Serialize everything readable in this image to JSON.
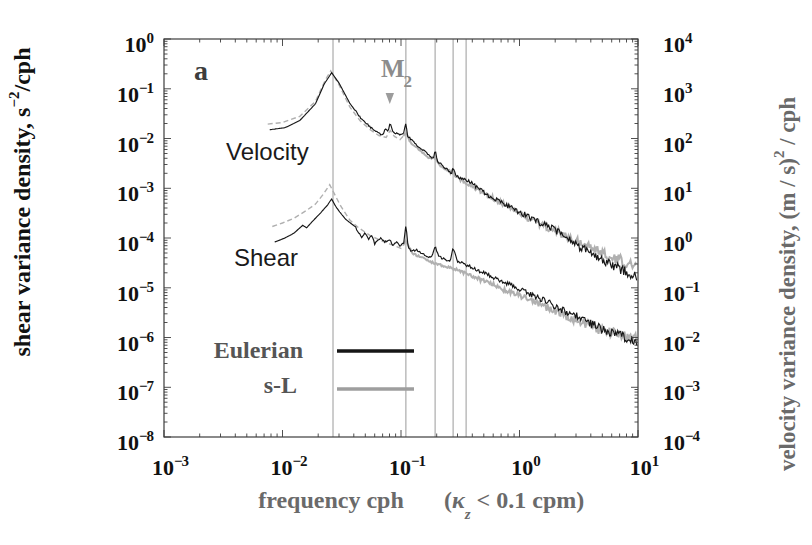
{
  "figure": {
    "panel_label": "a",
    "background": "#ffffff"
  },
  "colors": {
    "eulerian": "#161616",
    "sl": "#b0b0b0",
    "legend_sl_line": "#9e9e9e",
    "grid": "#9a9a9a",
    "frame": "#3c3c3c",
    "tick_text": "#111111",
    "muted_text": "#6a6a6a",
    "legend_text": "#555555",
    "panel_text": "#3d3d3d",
    "m2_text": "#8c8c8c",
    "arrow": "#9c9c9c"
  },
  "axes": {
    "x": {
      "title": "frequency cph",
      "note_open": "(",
      "note_kappa": "κ",
      "note_sub": "z",
      "note_rest": " < 0.1 cpm)",
      "tick_base": "10",
      "tick_exponents": [
        -3,
        -2,
        -1,
        0,
        1
      ]
    },
    "y_left": {
      "title_main": "shear variance density, s",
      "title_sup": "−2",
      "title_suffix": "/cph",
      "tick_base": "10",
      "tick_exponents": [
        0,
        -1,
        -2,
        -3,
        -4,
        -5,
        -6,
        -7,
        -8
      ]
    },
    "y_right": {
      "title_main": "velocity variance density,  (m / s)",
      "title_sup": "2",
      "title_suffix": " / cph",
      "tick_base": "10",
      "tick_exponents": [
        4,
        3,
        2,
        1,
        0,
        -1,
        -2,
        -3,
        -4
      ]
    }
  },
  "annotations": {
    "velocity_group": "Velocity",
    "shear_group": "Shear",
    "m2_main": "M",
    "m2_sub": "2"
  },
  "legend": {
    "items": [
      {
        "label": "Eulerian",
        "series": "eulerian"
      },
      {
        "label": "s-L",
        "series": "sl"
      }
    ]
  },
  "chart_data": {
    "type": "line",
    "title": "",
    "x_axis": {
      "label": "frequency cph",
      "note": "(κz < 0.1 cpm)",
      "scale": "log",
      "log_range": [
        -3,
        1
      ],
      "units": "cph"
    },
    "y_left_axis": {
      "label": "shear variance density, s−2/cph",
      "scale": "log",
      "log_range": [
        -8,
        0
      ]
    },
    "y_right_axis": {
      "label": "velocity variance density, (m / s)2 / cph",
      "scale": "log",
      "log_range": [
        -4,
        4
      ]
    },
    "grid": "vertical-reference-lines-only",
    "legend_position": "lower-left-inside",
    "vertical_gridlines_cph": [
      0.0267,
      0.11,
      0.194,
      0.275,
      0.354
    ],
    "m2_annotation": {
      "text": "M2",
      "freq_cph": 0.0805
    },
    "series": [
      {
        "name": "velocity-eulerian",
        "group": "Velocity",
        "method": "Eulerian",
        "axis": "right",
        "color": "#161616",
        "style": "solid",
        "points": [
          [
            0.0078,
            150
          ],
          [
            0.0105,
            165
          ],
          [
            0.014,
            230
          ],
          [
            0.019,
            500
          ],
          [
            0.0225,
            1250
          ],
          [
            0.026,
            2100
          ],
          [
            0.03,
            1300
          ],
          [
            0.037,
            510
          ],
          [
            0.045,
            270
          ],
          [
            0.055,
            170
          ],
          [
            0.064,
            128
          ],
          [
            0.07,
            118
          ],
          [
            0.0735,
            155
          ],
          [
            0.078,
            135
          ],
          [
            0.081,
            210
          ],
          [
            0.085,
            140
          ],
          [
            0.092,
            125
          ],
          [
            0.098,
            118
          ],
          [
            0.106,
            135
          ],
          [
            0.11,
            205
          ],
          [
            0.114,
            110
          ],
          [
            0.121,
            98
          ],
          [
            0.137,
            72
          ],
          [
            0.155,
            58
          ],
          [
            0.175,
            44
          ],
          [
            0.188,
            38
          ],
          [
            0.194,
            62
          ],
          [
            0.203,
            35
          ],
          [
            0.22,
            30
          ],
          [
            0.245,
            24
          ],
          [
            0.266,
            20
          ],
          [
            0.275,
            26
          ],
          [
            0.29,
            18.5
          ],
          [
            0.32,
            16
          ],
          [
            0.385,
            13.4
          ],
          [
            0.47,
            9.2
          ],
          [
            0.57,
            6.7
          ],
          [
            0.7,
            5.2
          ],
          [
            0.83,
            4.2
          ],
          [
            1.0,
            3.3
          ],
          [
            1.22,
            2.65
          ],
          [
            1.55,
            1.95
          ],
          [
            2.0,
            1.45
          ],
          [
            2.55,
            1.0
          ],
          [
            3.2,
            0.66
          ],
          [
            4.1,
            0.48
          ],
          [
            5.3,
            0.33
          ],
          [
            6.5,
            0.26
          ],
          [
            7.8,
            0.21
          ],
          [
            9.8,
            0.165
          ]
        ]
      },
      {
        "name": "velocity-s-L",
        "group": "Velocity",
        "method": "s-L",
        "axis": "right",
        "color": "#b0b0b0",
        "style": "dashed-then-solid",
        "points": [
          [
            0.0075,
            195
          ],
          [
            0.01,
            210
          ],
          [
            0.014,
            280
          ],
          [
            0.019,
            560
          ],
          [
            0.023,
            1500
          ],
          [
            0.0255,
            2300
          ],
          [
            0.03,
            1200
          ],
          [
            0.037,
            430
          ],
          [
            0.045,
            230
          ],
          [
            0.055,
            150
          ],
          [
            0.065,
            115
          ],
          [
            0.075,
            105
          ],
          [
            0.081,
            145
          ],
          [
            0.088,
            110
          ],
          [
            0.098,
            95
          ],
          [
            0.11,
            128
          ],
          [
            0.12,
            85
          ],
          [
            0.14,
            62
          ],
          [
            0.17,
            42
          ],
          [
            0.194,
            40
          ],
          [
            0.22,
            26
          ],
          [
            0.275,
            20
          ],
          [
            0.32,
            14.5
          ],
          [
            0.4,
            11
          ],
          [
            0.5,
            8
          ],
          [
            0.65,
            5.6
          ],
          [
            0.85,
            3.9
          ],
          [
            1.1,
            2.8
          ],
          [
            1.5,
            1.9
          ],
          [
            2.0,
            1.4
          ],
          [
            2.6,
            1.05
          ],
          [
            3.3,
            0.78
          ],
          [
            4.3,
            0.58
          ],
          [
            5.5,
            0.45
          ],
          [
            7.0,
            0.36
          ],
          [
            9.8,
            0.28
          ]
        ]
      },
      {
        "name": "shear-eulerian",
        "group": "Shear",
        "method": "Eulerian",
        "axis": "left",
        "color": "#161616",
        "style": "solid",
        "points": [
          [
            0.0086,
            8.3e-05
          ],
          [
            0.0105,
            0.0001
          ],
          [
            0.0125,
            0.000125
          ],
          [
            0.0148,
            0.00018
          ],
          [
            0.016,
            0.00016
          ],
          [
            0.0177,
            0.00021
          ],
          [
            0.021,
            0.00032
          ],
          [
            0.024,
            0.00046
          ],
          [
            0.026,
            0.00061
          ],
          [
            0.028,
            0.00044
          ],
          [
            0.0305,
            0.00033
          ],
          [
            0.034,
            0.00024
          ],
          [
            0.0365,
            0.00021
          ],
          [
            0.041,
            0.00017
          ],
          [
            0.0465,
            0.000105
          ],
          [
            0.05,
            0.000125
          ],
          [
            0.053,
            9.5e-05
          ],
          [
            0.057,
            0.000115
          ],
          [
            0.06,
            7.6e-05
          ],
          [
            0.064,
            9e-05
          ],
          [
            0.068,
            0.0001
          ],
          [
            0.0735,
            8.3e-05
          ],
          [
            0.08,
            9.5e-05
          ],
          [
            0.085,
            7.2e-05
          ],
          [
            0.092,
            8.2e-05
          ],
          [
            0.098,
            6.8e-05
          ],
          [
            0.106,
            8e-05
          ],
          [
            0.11,
            0.000185
          ],
          [
            0.115,
            6.4e-05
          ],
          [
            0.122,
            5.4e-05
          ],
          [
            0.135,
            5.8e-05
          ],
          [
            0.15,
            4.8e-05
          ],
          [
            0.165,
            4.4e-05
          ],
          [
            0.18,
            4e-05
          ],
          [
            0.194,
            6.8e-05
          ],
          [
            0.21,
            4.2e-05
          ],
          [
            0.235,
            3.7e-05
          ],
          [
            0.26,
            3.3e-05
          ],
          [
            0.275,
            6.5e-05
          ],
          [
            0.3,
            3.4e-05
          ],
          [
            0.35,
            2.9e-05
          ],
          [
            0.42,
            2.4e-05
          ],
          [
            0.52,
            1.9e-05
          ],
          [
            0.65,
            1.5e-05
          ],
          [
            0.8,
            1.2e-05
          ],
          [
            1.0,
            9.3e-06
          ],
          [
            1.3,
            7e-06
          ],
          [
            1.7,
            5.2e-06
          ],
          [
            2.2,
            3.8e-06
          ],
          [
            2.9,
            2.8e-06
          ],
          [
            3.8,
            2.05e-06
          ],
          [
            5.0,
            1.5e-06
          ],
          [
            6.5,
            1.15e-06
          ],
          [
            8.0,
            9.7e-07
          ],
          [
            9.8,
            8.5e-07
          ]
        ]
      },
      {
        "name": "shear-s-L",
        "group": "Shear",
        "method": "s-L",
        "axis": "left",
        "color": "#b0b0b0",
        "style": "dashed-then-solid",
        "points": [
          [
            0.0082,
            0.00017
          ],
          [
            0.01,
            0.0002
          ],
          [
            0.0125,
            0.00025
          ],
          [
            0.016,
            0.00036
          ],
          [
            0.019,
            0.00048
          ],
          [
            0.022,
            0.00075
          ],
          [
            0.025,
            0.00118
          ],
          [
            0.028,
            0.0007
          ],
          [
            0.031,
            0.00044
          ],
          [
            0.037,
            0.00023
          ],
          [
            0.044,
            0.00016
          ],
          [
            0.055,
            0.000112
          ],
          [
            0.07,
            8.6e-05
          ],
          [
            0.085,
            7.2e-05
          ],
          [
            0.1,
            6.2e-05
          ],
          [
            0.11,
            8.8e-05
          ],
          [
            0.125,
            4.9e-05
          ],
          [
            0.15,
            4e-05
          ],
          [
            0.18,
            3.3e-05
          ],
          [
            0.21,
            2.9e-05
          ],
          [
            0.25,
            2.6e-05
          ],
          [
            0.3,
            2.25e-05
          ],
          [
            0.37,
            1.85e-05
          ],
          [
            0.47,
            1.45e-05
          ],
          [
            0.6,
            1.15e-05
          ],
          [
            0.78,
            8.8e-06
          ],
          [
            1.0,
            6.9e-06
          ],
          [
            1.35,
            5.1e-06
          ],
          [
            1.8,
            3.8e-06
          ],
          [
            2.4,
            2.85e-06
          ],
          [
            3.2,
            2.1e-06
          ],
          [
            4.2,
            1.6e-06
          ],
          [
            5.5,
            1.3e-06
          ],
          [
            7.0,
            1.12e-06
          ],
          [
            9.8,
            9.8e-07
          ]
        ]
      }
    ]
  }
}
